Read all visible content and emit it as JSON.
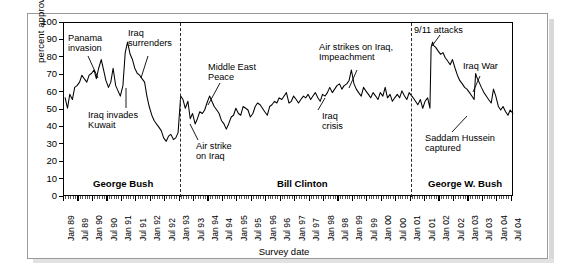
{
  "chart_data": {
    "type": "line",
    "title": "",
    "xlabel": "Survey date",
    "ylabel": "percent approving",
    "ylim": [
      0,
      100
    ],
    "ytick_labels": [
      "0",
      "10",
      "20",
      "30",
      "40",
      "50",
      "60",
      "70",
      "80",
      "90",
      "100"
    ],
    "ytick_values": [
      0,
      10,
      20,
      30,
      40,
      50,
      60,
      70,
      80,
      90,
      100
    ],
    "grid": false,
    "legend": "none",
    "xlim": [
      "Jan 89",
      "Jul 04"
    ],
    "xtick_labels": [
      "Jan 89",
      "Jul 89",
      "Jan 90",
      "Jul 90",
      "Jan 91",
      "Jul 91",
      "Jan 92",
      "Jul 92",
      "Jan 93",
      "Jul 93",
      "Jan 94",
      "Jul 94",
      "Jan 95",
      "Jul 95",
      "Jan 96",
      "Jul 96",
      "Jan 97",
      "Jul 97",
      "Jan 98",
      "Jul 98",
      "Jan 99",
      "Jul 99",
      "Jan 00",
      "Jul 00",
      "Jan 01",
      "Jul 01",
      "Jan 02",
      "Jul 02",
      "Jan 03",
      "Jul 03",
      "Jan 04",
      "Jul 04"
    ],
    "series": [
      {
        "name": "Presidential approval",
        "color": "#000000",
        "x": [
          1989.04,
          1989.12,
          1989.2,
          1989.29,
          1989.37,
          1989.45,
          1989.54,
          1989.62,
          1989.7,
          1989.79,
          1989.87,
          1989.95,
          1990.04,
          1990.12,
          1990.2,
          1990.29,
          1990.37,
          1990.45,
          1990.54,
          1990.62,
          1990.7,
          1990.79,
          1990.87,
          1990.95,
          1991.04,
          1991.12,
          1991.2,
          1991.29,
          1991.37,
          1991.45,
          1991.54,
          1991.62,
          1991.7,
          1991.79,
          1991.87,
          1991.95,
          1992.04,
          1992.12,
          1992.2,
          1992.29,
          1992.37,
          1992.45,
          1992.54,
          1992.62,
          1992.7,
          1992.79,
          1992.87,
          1992.95,
          1993.04,
          1993.12,
          1993.2,
          1993.29,
          1993.37,
          1993.45,
          1993.54,
          1993.62,
          1993.7,
          1993.79,
          1993.87,
          1993.95,
          1994.04,
          1994.12,
          1994.2,
          1994.29,
          1994.37,
          1994.45,
          1994.54,
          1994.62,
          1994.7,
          1994.79,
          1994.87,
          1994.95,
          1995.04,
          1995.12,
          1995.2,
          1995.29,
          1995.37,
          1995.45,
          1995.54,
          1995.62,
          1995.7,
          1995.79,
          1995.87,
          1995.95,
          1996.04,
          1996.12,
          1996.2,
          1996.29,
          1996.37,
          1996.45,
          1996.54,
          1996.62,
          1996.7,
          1996.79,
          1996.87,
          1996.95,
          1997.04,
          1997.12,
          1997.2,
          1997.29,
          1997.37,
          1997.45,
          1997.54,
          1997.62,
          1997.7,
          1997.79,
          1997.87,
          1997.95,
          1998.04,
          1998.12,
          1998.2,
          1998.29,
          1998.37,
          1998.45,
          1998.54,
          1998.62,
          1998.7,
          1998.79,
          1998.87,
          1998.95,
          1999.04,
          1999.12,
          1999.2,
          1999.29,
          1999.37,
          1999.45,
          1999.54,
          1999.62,
          1999.7,
          1999.79,
          1999.87,
          1999.95,
          2000.04,
          2000.12,
          2000.2,
          2000.29,
          2000.37,
          2000.45,
          2000.54,
          2000.62,
          2000.7,
          2000.79,
          2000.87,
          2000.95,
          2001.09,
          2001.17,
          2001.25,
          2001.34,
          2001.42,
          2001.5,
          2001.59,
          2001.67,
          2001.71,
          2001.76,
          2001.8,
          2001.87,
          2001.95,
          2002.04,
          2002.12,
          2002.2,
          2002.29,
          2002.37,
          2002.45,
          2002.54,
          2002.62,
          2002.7,
          2002.79,
          2002.87,
          2002.95,
          2003.04,
          2003.12,
          2003.2,
          2003.25,
          2003.29,
          2003.37,
          2003.45,
          2003.54,
          2003.62,
          2003.7,
          2003.79,
          2003.87,
          2003.95,
          2004.04,
          2004.12,
          2004.2,
          2004.29,
          2004.37,
          2004.45,
          2004.54
        ],
        "y": [
          57,
          51,
          59,
          56,
          63,
          64,
          66,
          70,
          68,
          66,
          70,
          71,
          73,
          68,
          74,
          79,
          73,
          67,
          63,
          66,
          74,
          64,
          61,
          58,
          64,
          83,
          89,
          82,
          79,
          74,
          71,
          70,
          68,
          66,
          58,
          52,
          47,
          44,
          42,
          40,
          38,
          34,
          32,
          35,
          36,
          33,
          34,
          37,
          58,
          56,
          51,
          55,
          45,
          48,
          42,
          45,
          49,
          48,
          50,
          54,
          58,
          55,
          52,
          50,
          48,
          44,
          42,
          39,
          42,
          46,
          47,
          51,
          48,
          47,
          52,
          51,
          50,
          46,
          48,
          52,
          54,
          53,
          51,
          49,
          47,
          52,
          53,
          55,
          54,
          57,
          56,
          58,
          60,
          54,
          55,
          58,
          56,
          54,
          56,
          58,
          57,
          59,
          56,
          58,
          60,
          57,
          55,
          59,
          58,
          60,
          63,
          60,
          62,
          64,
          65,
          62,
          64,
          65,
          67,
          73,
          65,
          62,
          60,
          58,
          63,
          61,
          59,
          57,
          60,
          58,
          56,
          60,
          58,
          63,
          57,
          59,
          55,
          57,
          59,
          57,
          61,
          58,
          56,
          60,
          57,
          55,
          53,
          56,
          51,
          55,
          57,
          51,
          86,
          89,
          87,
          86,
          84,
          82,
          83,
          80,
          78,
          76,
          79,
          74,
          70,
          67,
          65,
          63,
          62,
          60,
          58,
          56,
          71,
          69,
          66,
          63,
          60,
          58,
          56,
          54,
          62,
          58,
          52,
          50,
          52,
          49,
          47,
          50,
          48
        ]
      }
    ],
    "era_dividers": [
      {
        "label": "George Bush",
        "start": "Jan 89",
        "end": "Jan 93"
      },
      {
        "label": "Bill Clinton",
        "start": "Jan 93",
        "end": "Jan 01"
      },
      {
        "label": "George W. Bush",
        "start": "Jan 01",
        "end": "Jul 04"
      }
    ],
    "annotations": [
      {
        "text": "Panama\ninvasion",
        "line1": "Panama",
        "line2": "invasion"
      },
      {
        "text": "Iraq\nsurrenders",
        "line1": "Iraq",
        "line2": "surrenders"
      },
      {
        "text": "Iraq invades\nKuwait",
        "line1": "Iraq invades",
        "line2": "Kuwait"
      },
      {
        "text": "Middle East\nPeace",
        "line1": "Middle East",
        "line2": "Peace"
      },
      {
        "text": "Air strike\non Iraq",
        "line1": "Air strike",
        "line2": "on Iraq"
      },
      {
        "text": "Air strikes on Iraq,\nImpeachment",
        "line1": "Air strikes on Iraq,",
        "line2": "Impeachment"
      },
      {
        "text": "Iraq\ncrisis",
        "line1": "Iraq",
        "line2": "crisis"
      },
      {
        "text": "9/11 attacks",
        "line1": "9/11 attacks",
        "line2": ""
      },
      {
        "text": "Iraq War",
        "line1": "Iraq War",
        "line2": ""
      },
      {
        "text": "Saddam Hussein\ncaptured",
        "line1": "Saddam Hussein",
        "line2": "captured"
      }
    ]
  },
  "axis": {
    "y_title": "percent approving",
    "x_title": "Survey date",
    "y_ticks": [
      "100",
      "90",
      "80",
      "70",
      "60",
      "50",
      "40",
      "30",
      "20",
      "10",
      "0"
    ]
  },
  "eras": {
    "bush41": "George Bush",
    "clinton": "Bill Clinton",
    "bush43": "George W. Bush"
  },
  "annotations": {
    "panama_l1": "Panama",
    "panama_l2": "invasion",
    "surrender_l1": "Iraq",
    "surrender_l2": "surrenders",
    "kuwait_l1": "Iraq invades",
    "kuwait_l2": "Kuwait",
    "mepeace_l1": "Middle East",
    "mepeace_l2": "Peace",
    "airstrike_l1": "Air strike",
    "airstrike_l2": "on Iraq",
    "airstrikes_l1": "Air strikes on Iraq,",
    "airstrikes_l2": "Impeachment",
    "iraqcrisis_l1": "Iraq",
    "iraqcrisis_l2": "crisis",
    "nineeleven": "9/11 attacks",
    "iraqwar": "Iraq War",
    "saddam_l1": "Saddam Hussein",
    "saddam_l2": "captured"
  },
  "xlabels": [
    "Jan 89",
    "Jul 89",
    "Jan 90",
    "Jul 90",
    "Jan 91",
    "Jul 91",
    "Jan 92",
    "Jul 92",
    "Jan 93",
    "Jul 93",
    "Jan 94",
    "Jul 94",
    "Jan 95",
    "Jul 95",
    "Jan 96",
    "Jul 96",
    "Jan 97",
    "Jul 97",
    "Jan 98",
    "Jul 98",
    "Jan 99",
    "Jul 99",
    "Jan 00",
    "Jul 00",
    "Jan 01",
    "Jul 01",
    "Jan 02",
    "Jul 02",
    "Jan 03",
    "Jul 03",
    "Jan 04",
    "Jul 04"
  ]
}
